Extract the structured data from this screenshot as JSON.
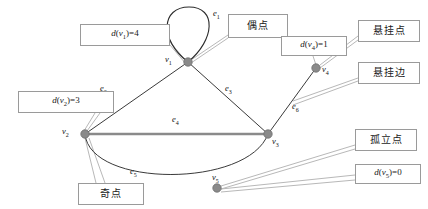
{
  "diagram": {
    "colors": {
      "edge": "#3a3a3a",
      "loop": "#222222",
      "vertex": "#8a8a8a",
      "vertex_stroke": "#6e6e6e",
      "box_border": "#9a9a9a",
      "leader_line": "#b5b5b5",
      "thick_edge": "#7a7a7a",
      "background": "#ffffff"
    },
    "vertices": [
      {
        "id": "v1",
        "label": "v",
        "sub": "1",
        "x": 188,
        "y": 62,
        "label_x": 168,
        "label_y": 60,
        "degree": 4
      },
      {
        "id": "v2",
        "label": "v",
        "sub": "2",
        "x": 85,
        "y": 134,
        "label_x": 64,
        "label_y": 132,
        "degree": 3
      },
      {
        "id": "v3",
        "label": "v",
        "sub": "3",
        "x": 268,
        "y": 134,
        "label_x": 272,
        "label_y": 138,
        "degree": 3
      },
      {
        "id": "v4",
        "label": "v",
        "sub": "4",
        "x": 316,
        "y": 68,
        "label_x": 322,
        "label_y": 68,
        "degree": 1
      },
      {
        "id": "v5",
        "label": "v",
        "sub": "5",
        "x": 217,
        "y": 188,
        "label_x": 213,
        "label_y": 175,
        "degree": 0
      }
    ],
    "edges": [
      {
        "id": "e1",
        "label": "e",
        "sub": "1",
        "kind": "loop",
        "from": "v1",
        "to": "v1",
        "label_x": 217,
        "label_y": 14
      },
      {
        "id": "e2",
        "label": "e",
        "sub": "2",
        "kind": "straight",
        "from": "v2",
        "to": "v1",
        "label_x": 104,
        "label_y": 88
      },
      {
        "id": "e3",
        "label": "e",
        "sub": "3",
        "kind": "straight",
        "from": "v1",
        "to": "v3",
        "label_x": 228,
        "label_y": 88
      },
      {
        "id": "e4",
        "label": "e",
        "sub": "4",
        "kind": "thick-straight",
        "from": "v2",
        "to": "v3",
        "label_x": 176,
        "label_y": 120
      },
      {
        "id": "e5",
        "label": "e",
        "sub": "5",
        "kind": "arc",
        "from": "v2",
        "to": "v3",
        "label_x": 134,
        "label_y": 172
      },
      {
        "id": "e6",
        "label": "e",
        "sub": "6",
        "kind": "straight",
        "from": "v3",
        "to": "v4",
        "label_x": 295,
        "label_y": 106
      }
    ],
    "callouts": [
      {
        "id": "deg-v1",
        "text": "d(v₁)=4",
        "html": "<i>d</i>(<i>v</i><sub>1</sub>)=4",
        "x": 80,
        "y": 24,
        "w": 90,
        "h": 22,
        "cjk": false,
        "target": "v1"
      },
      {
        "id": "even-vertex",
        "text": "偶点",
        "html": "偶点",
        "x": 228,
        "y": 14,
        "w": 60,
        "h": 24,
        "cjk": true,
        "target": "v1"
      },
      {
        "id": "deg-v4",
        "text": "d(v₄)=1",
        "html": "<i>d</i>(<i>v</i><sub>4</sub>)=1",
        "x": 281,
        "y": 36,
        "w": 66,
        "h": 20,
        "cjk": false,
        "target": "v4"
      },
      {
        "id": "pendant-vertex",
        "text": "悬挂点",
        "html": "悬挂点",
        "x": 358,
        "y": 20,
        "w": 62,
        "h": 22,
        "cjk": true,
        "target": "v4"
      },
      {
        "id": "pendant-edge",
        "text": "悬挂边",
        "html": "悬挂边",
        "x": 358,
        "y": 62,
        "w": 62,
        "h": 22,
        "cjk": true,
        "target": "e6"
      },
      {
        "id": "deg-v2",
        "text": "d(v₂)=3",
        "html": "<i>d</i>(<i>v</i><sub>2</sub>)=3",
        "x": 18,
        "y": 91,
        "w": 96,
        "h": 22,
        "cjk": false,
        "target": "v2"
      },
      {
        "id": "odd-vertex",
        "text": "奇点",
        "html": "奇点",
        "x": 78,
        "y": 183,
        "w": 66,
        "h": 22,
        "cjk": true,
        "target": "v2"
      },
      {
        "id": "isolated-vertex",
        "text": "孤立点",
        "html": "孤立点",
        "x": 355,
        "y": 129,
        "w": 62,
        "h": 22,
        "cjk": true,
        "target": "v5"
      },
      {
        "id": "deg-v5",
        "text": "d(v₅)=0",
        "html": "<i>d</i>(<i>v</i><sub>5</sub>)=0",
        "x": 355,
        "y": 164,
        "w": 66,
        "h": 20,
        "cjk": false,
        "target": "v5"
      }
    ],
    "leader_lines": [
      {
        "id": "lead-deg-v1-a",
        "x1": 170,
        "y1": 42,
        "x2": 186,
        "y2": 61
      },
      {
        "id": "lead-deg-v1-b",
        "x1": 170,
        "y1": 45,
        "x2": 186,
        "y2": 63
      },
      {
        "id": "lead-even-a",
        "x1": 228,
        "y1": 36,
        "x2": 190,
        "y2": 61
      },
      {
        "id": "lead-even-b",
        "x1": 228,
        "y1": 38,
        "x2": 190,
        "y2": 63
      },
      {
        "id": "lead-deg-v4-a",
        "x1": 314,
        "y1": 56,
        "x2": 316,
        "y2": 66
      },
      {
        "id": "lead-pendant-v-a",
        "x1": 358,
        "y1": 36,
        "x2": 319,
        "y2": 66
      },
      {
        "id": "lead-pendant-v-b",
        "x1": 358,
        "y1": 40,
        "x2": 319,
        "y2": 69
      },
      {
        "id": "lead-pendant-e-a",
        "x1": 358,
        "y1": 78,
        "x2": 294,
        "y2": 102
      },
      {
        "id": "lead-pendant-e-b",
        "x1": 358,
        "y1": 81,
        "x2": 294,
        "y2": 105
      },
      {
        "id": "lead-deg-v2-a",
        "x1": 96,
        "y1": 113,
        "x2": 85,
        "y2": 132
      },
      {
        "id": "lead-deg-v2-b",
        "x1": 100,
        "y1": 113,
        "x2": 87,
        "y2": 132
      },
      {
        "id": "lead-odd-a",
        "x1": 96,
        "y1": 183,
        "x2": 85,
        "y2": 137
      },
      {
        "id": "lead-odd-b",
        "x1": 104,
        "y1": 183,
        "x2": 88,
        "y2": 137
      },
      {
        "id": "lead-isolated-a",
        "x1": 355,
        "y1": 145,
        "x2": 220,
        "y2": 187
      },
      {
        "id": "lead-isolated-b",
        "x1": 355,
        "y1": 148,
        "x2": 220,
        "y2": 190
      },
      {
        "id": "lead-deg-v5-a",
        "x1": 355,
        "y1": 176,
        "x2": 220,
        "y2": 190
      },
      {
        "id": "lead-deg-v5-b",
        "x1": 355,
        "y1": 180,
        "x2": 220,
        "y2": 192
      }
    ],
    "loop_path": "M 188 62 C 160 38, 162 6, 189 6 C 216 6, 214 38, 188 62",
    "arc_path": "M 85 134 C 92 186, 246 186, 268 134"
  }
}
